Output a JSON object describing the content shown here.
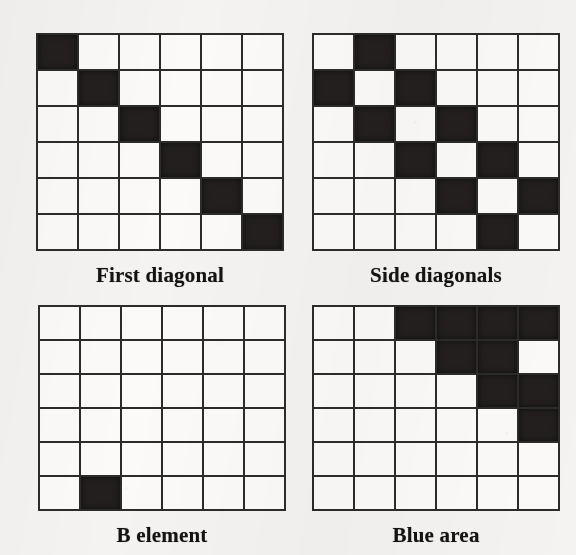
{
  "figure": {
    "grid_rows": 6,
    "grid_cols": 6,
    "ink_color": "#221f1e",
    "cell_color": "#fbfaf8",
    "paper_color": "#f4f3f1"
  },
  "panels": [
    {
      "id": "first-diagonal",
      "caption": "First diagonal",
      "rows": [
        [
          1,
          0,
          0,
          0,
          0,
          0
        ],
        [
          0,
          1,
          0,
          0,
          0,
          0
        ],
        [
          0,
          0,
          1,
          0,
          0,
          0
        ],
        [
          0,
          0,
          0,
          1,
          0,
          0
        ],
        [
          0,
          0,
          0,
          0,
          1,
          0
        ],
        [
          0,
          0,
          0,
          0,
          0,
          1
        ]
      ],
      "filled_count": 6
    },
    {
      "id": "side-diagonals",
      "caption": "Side diagonals",
      "rows": [
        [
          0,
          1,
          0,
          0,
          0,
          0
        ],
        [
          1,
          0,
          1,
          0,
          0,
          0
        ],
        [
          0,
          1,
          0,
          1,
          0,
          0
        ],
        [
          0,
          0,
          1,
          0,
          1,
          0
        ],
        [
          0,
          0,
          0,
          1,
          0,
          1
        ],
        [
          0,
          0,
          0,
          0,
          1,
          0
        ]
      ],
      "filled_count": 10
    },
    {
      "id": "b-element",
      "caption": "B element",
      "rows": [
        [
          0,
          0,
          0,
          0,
          0,
          0
        ],
        [
          0,
          0,
          0,
          0,
          0,
          0
        ],
        [
          0,
          0,
          0,
          0,
          0,
          0
        ],
        [
          0,
          0,
          0,
          0,
          0,
          0
        ],
        [
          0,
          0,
          0,
          0,
          0,
          0
        ],
        [
          0,
          1,
          0,
          0,
          0,
          0
        ]
      ],
      "filled_count": 1
    },
    {
      "id": "blue-area",
      "caption": "Blue area",
      "rows": [
        [
          0,
          0,
          1,
          1,
          1,
          1
        ],
        [
          0,
          0,
          0,
          1,
          1,
          0
        ],
        [
          0,
          0,
          0,
          0,
          1,
          1
        ],
        [
          0,
          0,
          0,
          0,
          0,
          1
        ],
        [
          0,
          0,
          0,
          0,
          0,
          0
        ],
        [
          0,
          0,
          0,
          0,
          0,
          0
        ]
      ],
      "filled_count": 9
    }
  ]
}
